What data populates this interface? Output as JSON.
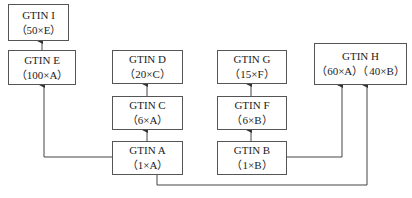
{
  "diagram": {
    "nodes": [
      {
        "id": "I",
        "title": "GTIN I",
        "qty": "（50×E）"
      },
      {
        "id": "E",
        "title": "GTIN E",
        "qty": "（100×A）"
      },
      {
        "id": "D",
        "title": "GTIN D",
        "qty": "（20×C）"
      },
      {
        "id": "C",
        "title": "GTIN C",
        "qty": "（6×A）"
      },
      {
        "id": "A",
        "title": "GTIN A",
        "qty": "（1×A）"
      },
      {
        "id": "G",
        "title": "GTIN G",
        "qty": "（15×F）"
      },
      {
        "id": "F",
        "title": "GTIN F",
        "qty": "（6×B）"
      },
      {
        "id": "B",
        "title": "GTIN B",
        "qty": "（1×B）"
      },
      {
        "id": "H",
        "title": "GTIN H",
        "qty": "（60×A）（40×B）"
      }
    ],
    "edges": [
      {
        "from": "E",
        "to": "I"
      },
      {
        "from": "A",
        "to": "E"
      },
      {
        "from": "C",
        "to": "D"
      },
      {
        "from": "A",
        "to": "C"
      },
      {
        "from": "F",
        "to": "G"
      },
      {
        "from": "B",
        "to": "F"
      },
      {
        "from": "B",
        "to": "H"
      },
      {
        "from": "A",
        "to": "H"
      }
    ],
    "colors": {
      "line": "#444444",
      "border": "#555555",
      "background": "#ffffff"
    }
  }
}
